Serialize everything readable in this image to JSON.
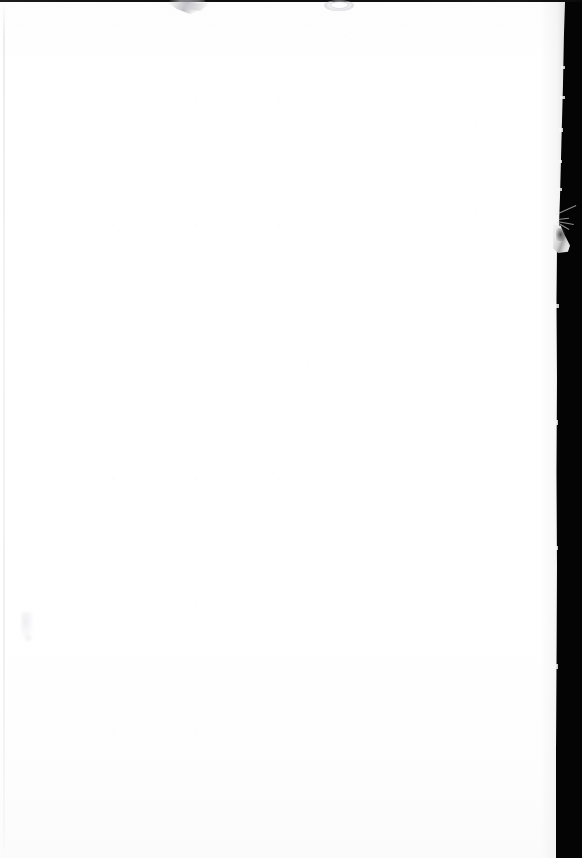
{
  "document": {
    "kind": "scanned-page",
    "content_text": "",
    "page_description": "Blank scanned sheet of paper on a black scanner background",
    "width_px": 582,
    "height_px": 858
  },
  "colors": {
    "background_black": "#040404",
    "paper_white": "#ffffff",
    "paper_offwhite": "#fdfdfd",
    "top_strip_dark": "#141414",
    "left_edge_line": "#e2e2e6",
    "smudge_gray": "#c6c6ca",
    "tear_highlight": "#f4f4f4"
  },
  "regions": {
    "scanner_bed": {
      "label": "scanner background"
    },
    "paper_sheet": {
      "label": "paper sheet"
    },
    "top_edge_strip": {
      "label": "top edge dark strip"
    },
    "left_edge_line": {
      "label": "left page edge line"
    },
    "right_edge": {
      "label": "right page edge"
    },
    "edge_tear": {
      "label": "torn page edge"
    },
    "smudge_wedge": {
      "label": "faint wedge smudge"
    },
    "smudge_oval": {
      "label": "faint oval smudge"
    },
    "blemish_lower_left": {
      "label": "faint lower-left blemish"
    }
  }
}
